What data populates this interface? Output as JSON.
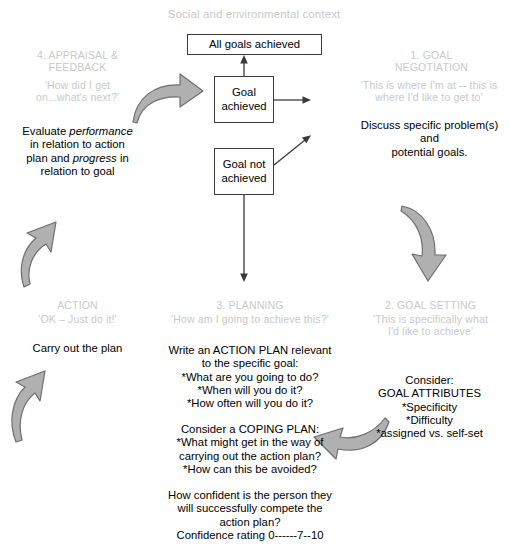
{
  "diagram": {
    "context_title": "Social and environmental context",
    "boxes": [
      {
        "id": "all-goals-achieved",
        "label": "All goals achieved"
      },
      {
        "id": "goal-achieved",
        "label": "Goal\nachieved"
      },
      {
        "id": "goal-not-achieved",
        "label": "Goal not\nachieved"
      }
    ],
    "stages": [
      {
        "id": "goal-negotiation",
        "heading": "1. GOAL\nNEGOTIATION",
        "quote": "'This is where I'm at -- this is\nwhere I'd like to get to'",
        "body": "Discuss specific problem(s) and\npotential goals."
      },
      {
        "id": "goal-setting",
        "heading": "2. GOAL SETTING",
        "quote": "'This is specifically what\nI'd like to achieve'",
        "body": "Consider:\nGOAL ATTRIBUTES\n*Specificity\n*Difficulty\n*assigned vs. self-set"
      },
      {
        "id": "planning",
        "heading": "3. PLANNING",
        "quote": "'How am I going to achieve this?'",
        "body_action_plan": "Write an ACTION PLAN relevant\nto the specific goal:\n*What are you going to do?\n*When will you do it?\n*How often will you do it?",
        "body_coping_plan": "Consider a COPING PLAN:\n*What might get in the way of\ncarrying out the action plan?\n*How can this be avoided?",
        "body_confidence": "How confident is the person they\nwill successfully compete the\naction plan?\nConfidence rating 0------7--10"
      },
      {
        "id": "action",
        "heading": "ACTION",
        "quote": "'OK – Just do it!'",
        "body": "Carry out the plan"
      },
      {
        "id": "appraisal-feedback",
        "heading": "4. APPRAISAL &\nFEEDBACK",
        "quote": "'How did I get\non...what's next?'",
        "body_prefix": "Evaluate ",
        "body_italic_1": "performance",
        "body_mid": "\nin relation to action\nplan and ",
        "body_italic_2": "progress",
        "body_suffix": " in\nrelation to goal"
      }
    ],
    "colors": {
      "grey_label": "#c9c9c9",
      "arrow_fill": "#b0b0b0",
      "arrow_stroke": "#6e6e6e",
      "box_stroke": "#3a3a3a",
      "text": "#000000"
    },
    "icons": {
      "cycle_arrow_right": "curved-arrow-right",
      "cycle_arrow_down_right": "curved-arrow-down",
      "cycle_arrow_left_down": "curved-arrow-left",
      "cycle_arrow_up_left": "curved-arrow-up",
      "connector_up": "line-arrow-up",
      "connector_right": "line-arrow-right",
      "connector_down": "line-arrow-down",
      "connector_diagonal": "line-arrow-diagonal-up-right"
    }
  }
}
